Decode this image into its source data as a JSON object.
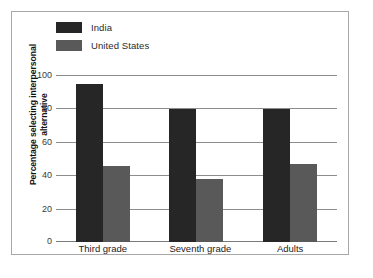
{
  "chart_data": {
    "type": "bar",
    "title": "",
    "xlabel": "",
    "ylabel": "Percentage selecting interpersonal alternative",
    "ylabel_line1": "Percentage selecting interpersonal",
    "ylabel_line2": "alternative",
    "ylim": [
      0,
      100
    ],
    "yticks": [
      "0",
      "20",
      "40",
      "60",
      "80",
      "100"
    ],
    "grid": "horizontal",
    "legend_position": "top-left",
    "categories": [
      "Third grade",
      "Seventh grade",
      "Adults"
    ],
    "series": [
      {
        "name": "India",
        "color": "#262626",
        "values": [
          95,
          80,
          80
        ]
      },
      {
        "name": "United States",
        "color": "#595959",
        "values": [
          46,
          38,
          47
        ]
      }
    ]
  },
  "legend": {
    "items": [
      {
        "label": "India",
        "swatch": "legend-swatch-india"
      },
      {
        "label": "United States",
        "swatch": "legend-swatch-united-states"
      }
    ]
  },
  "colors": {
    "india": "#262626",
    "united_states": "#595959",
    "gridline": "#8d8d8d",
    "frame_border": "#a8a8a8",
    "background": "#ffffff"
  }
}
